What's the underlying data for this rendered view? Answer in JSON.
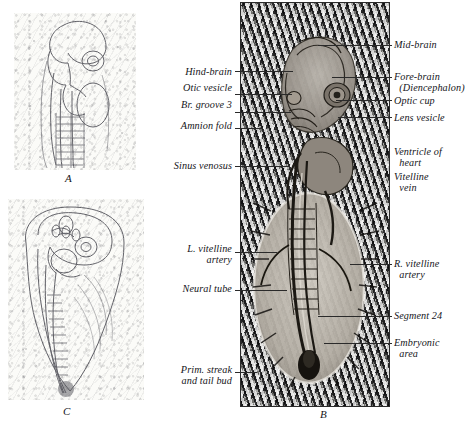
{
  "figure": {
    "panels": [
      {
        "id": "A",
        "letter": "A",
        "caption": "A"
      },
      {
        "id": "B",
        "letter": "B",
        "caption": "B"
      },
      {
        "id": "C",
        "letter": "C",
        "caption": "C"
      }
    ],
    "left_labels": [
      {
        "text": "Hind-brain",
        "name": "label-hind-brain"
      },
      {
        "text": "Otic vesicle",
        "name": "label-otic-vesicle"
      },
      {
        "text": "Br. groove 3",
        "name": "label-br-groove-3"
      },
      {
        "text": "Amnion fold",
        "name": "label-amnion-fold"
      },
      {
        "text": "Sinus venosus",
        "name": "label-sinus-venosus"
      },
      {
        "text": "L. vitelline\nartery",
        "name": "label-l-vitelline-artery"
      },
      {
        "text": "Neural tube",
        "name": "label-neural-tube"
      },
      {
        "text": "Prim. streak\nand tail bud",
        "name": "label-prim-streak-and-tail-bud"
      }
    ],
    "right_labels": [
      {
        "text": "Mid-brain",
        "name": "label-mid-brain"
      },
      {
        "text": "Fore-brain\n  (Diencephalon)",
        "name": "label-fore-brain-diencephalon"
      },
      {
        "text": "Optic cup",
        "name": "label-optic-cup"
      },
      {
        "text": "Lens vesicle",
        "name": "label-lens-vesicle"
      },
      {
        "text": "Ventricle of\n  heart",
        "name": "label-ventricle-of-heart"
      },
      {
        "text": "Vitelline\n  vein",
        "name": "label-vitelline-vein"
      },
      {
        "text": "R. vitelline\n  artery",
        "name": "label-r-vitelline-artery"
      },
      {
        "text": "Segment 24",
        "name": "label-segment-24"
      },
      {
        "text": "Embryonic\n  area",
        "name": "label-embryonic-area"
      }
    ]
  }
}
